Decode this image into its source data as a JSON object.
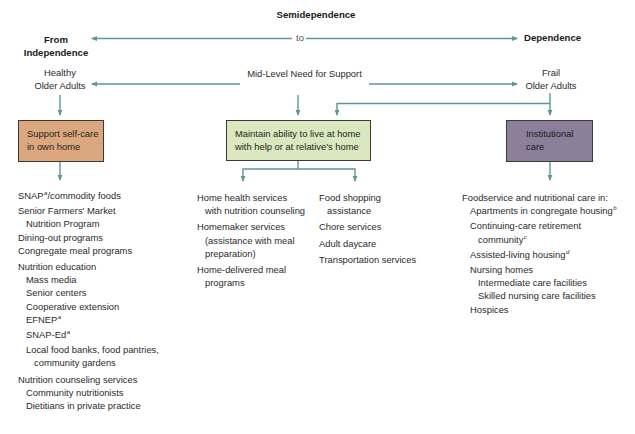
{
  "header": {
    "top_label": "Semidependence",
    "left_label_line1": "From",
    "left_label_line2": "Independence",
    "connector_label": "to",
    "right_label": "Dependence"
  },
  "continuum": {
    "left_line1": "Healthy",
    "left_line2": "Older Adults",
    "middle": "Mid-Level Need for Support",
    "right_line1": "Frail",
    "right_line2": "Older Adults"
  },
  "boxes": {
    "self_care": {
      "line1": "Support self-care",
      "line2": "in own home",
      "color": "#dca77f"
    },
    "live_at_home": {
      "line1": "Maintain ability to live at home",
      "line2": "with help or at relative's home",
      "color": "#d9e8bf"
    },
    "institutional": {
      "line1": "Institutional",
      "line2": "care",
      "color": "#8c7f9a"
    }
  },
  "colors": {
    "arrow": "#5d9797",
    "text": "#2a2a2a"
  },
  "lists": {
    "self_care": {
      "snap": "SNAP",
      "snap_sup": "a",
      "snap_rest": "/commodity foods",
      "farmers_1": "Senior Farmers' Market",
      "farmers_2": "Nutrition Program",
      "dining": "Dining-out programs",
      "congregate": "Congregate meal programs",
      "nutrition_ed": "Nutrition education",
      "mass_media": "Mass media",
      "senior_centers": "Senior centers",
      "coop": "Cooperative extension",
      "efnep": "EFNEP",
      "efnep_sup": "a",
      "snap_ed": "SNAP-Ed",
      "snap_ed_sup": "a",
      "food_banks_1": "Local food banks, food pantries,",
      "food_banks_2": "community gardens",
      "counseling": "Nutrition counseling services",
      "community_nutritionists": "Community nutritionists",
      "dietitians": "Dietitians in private practice"
    },
    "home_left": {
      "home_health_1": "Home health services",
      "home_health_2": "with nutrition counseling",
      "homemaker_1": "Homemaker services",
      "homemaker_2": "(assistance with meal",
      "homemaker_3": "preparation)",
      "home_delivered_1": "Home-delivered meal",
      "home_delivered_2": "programs"
    },
    "home_right": {
      "food_shopping_1": "Food shopping",
      "food_shopping_2": "assistance",
      "chore": "Chore services",
      "adult_daycare": "Adult daycare",
      "transportation": "Transportation services"
    },
    "institutional": {
      "intro": "Foodservice and nutritional care in:",
      "apartments": "Apartments in congregate housing",
      "apartments_sup": "b",
      "ccrc_1": "Continuing-care retirement",
      "ccrc_2": "community",
      "ccrc_sup": "c",
      "assisted": "Assisted-living housing",
      "assisted_sup": "d",
      "nursing": "Nursing homes",
      "intermediate": "Intermediate care facilities",
      "skilled": "Skilled nursing care facilities",
      "hospices": "Hospices"
    }
  }
}
